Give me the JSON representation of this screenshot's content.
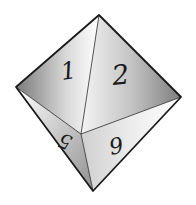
{
  "image": {
    "subject": "octahedral die (d8)",
    "background": "#ffffff",
    "outline_color": "#1a1a1a"
  },
  "faces": [
    {
      "label": "1",
      "position": "upper-left"
    },
    {
      "label": "2",
      "position": "upper-right"
    },
    {
      "label": "5",
      "position": "lower-left"
    },
    {
      "label": "9",
      "position": "lower-right"
    }
  ]
}
